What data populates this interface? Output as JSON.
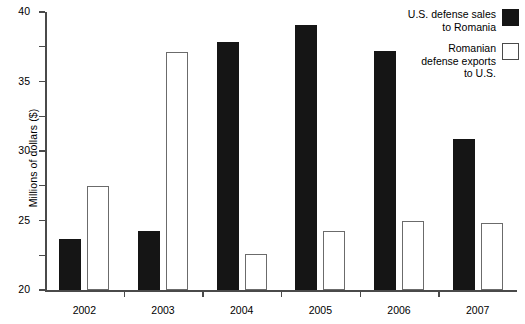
{
  "chart_data": {
    "type": "bar",
    "title": "",
    "xlabel": "",
    "ylabel": "Millions of dollars ($)",
    "categories": [
      "2002",
      "2003",
      "2004",
      "2005",
      "2006",
      "2007"
    ],
    "ylim": [
      0,
      40
    ],
    "yticks": [
      0,
      5,
      10,
      15,
      20,
      25,
      30,
      35,
      40
    ],
    "ytick_labels": [
      "0",
      "5",
      "10",
      "15",
      "20",
      "25",
      "30",
      "35",
      "40"
    ],
    "grid": false,
    "legend_position": "top-right",
    "series": [
      {
        "name": "U.S. defense sales to Romania",
        "legend_lines": [
          "U.S. defense sales",
          "to Romania"
        ],
        "color": "#151515",
        "swatch": "filled-black-square",
        "values": [
          7.4,
          8.5,
          35.7,
          38.2,
          34.4,
          21.8
        ]
      },
      {
        "name": "Romanian defense exports to U.S.",
        "legend_lines": [
          "Romanian",
          "defense exports",
          "to U.S."
        ],
        "color": "#ffffff",
        "swatch": "open-white-square",
        "values": [
          14.9,
          34.2,
          5.2,
          8.5,
          9.9,
          9.6
        ]
      }
    ]
  }
}
